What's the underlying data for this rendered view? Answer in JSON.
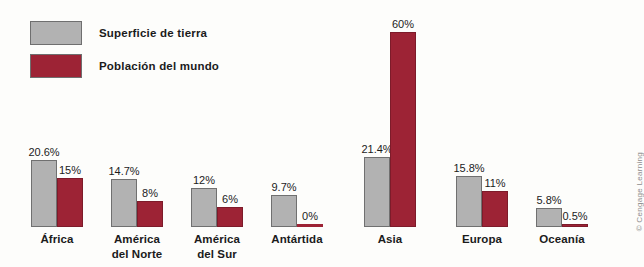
{
  "legend": {
    "items": [
      {
        "label": "Superficie de tierra",
        "color": "#b2b2b2",
        "swatch_name": "legend-swatch-land"
      },
      {
        "label": "Población del mundo",
        "color": "#9d2335",
        "swatch_name": "legend-swatch-population"
      }
    ]
  },
  "credit": {
    "text": "© Cengage Learning"
  },
  "chart_data": {
    "type": "bar",
    "title": "",
    "xlabel": "",
    "ylabel": "",
    "ylim": [
      0,
      62
    ],
    "grid": false,
    "legend_position": "top-left",
    "categories": [
      "África",
      "América\ndel Norte",
      "América\ndel Sur",
      "Antártida",
      "Asia",
      "Europa",
      "Oceanía"
    ],
    "category_lines": [
      [
        "África"
      ],
      [
        "América",
        "del Norte"
      ],
      [
        "América",
        "del Sur"
      ],
      [
        "Antártida"
      ],
      [
        "Asia"
      ],
      [
        "Europa"
      ],
      [
        "Oceanía"
      ]
    ],
    "series": [
      {
        "name": "Superficie de tierra",
        "color": "#b2b2b2",
        "values": [
          20.6,
          14.7,
          12,
          9.7,
          21.4,
          15.8,
          5.8
        ],
        "labels": [
          "20.6%",
          "14.7%",
          "12%",
          "9.7%",
          "21.4%",
          "15.8%",
          "5.8%"
        ]
      },
      {
        "name": "Población del mundo",
        "color": "#9d2335",
        "values": [
          15,
          8,
          6,
          0,
          60,
          11,
          0.5
        ],
        "labels": [
          "15%",
          "8%",
          "6%",
          "0%",
          "60%",
          "11%",
          "0.5%"
        ]
      }
    ]
  }
}
